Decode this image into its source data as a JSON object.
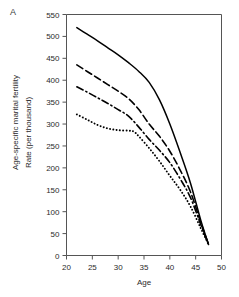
{
  "panel": {
    "label": "A"
  },
  "axes": {
    "x_title": "Age",
    "y_title_outer": "Age-specific marital fertility",
    "y_title_inner": "Rate (per thousand)"
  },
  "chart_data": {
    "type": "line",
    "title": "",
    "subtitle": "",
    "panel_label": "A",
    "xlabel": "Age",
    "ylabel": "Rate (per thousand)",
    "ylabel_secondary": "Age-specific marital fertility",
    "xlim": [
      20,
      50
    ],
    "ylim": [
      0,
      550
    ],
    "xticks": [
      20,
      25,
      30,
      35,
      40,
      45,
      50
    ],
    "yticks": [
      0,
      50,
      100,
      150,
      200,
      250,
      300,
      350,
      400,
      450,
      500,
      550
    ],
    "xtick_labels": [
      "20",
      "25",
      "30",
      "35",
      "40",
      "45",
      "50"
    ],
    "ytick_labels": [
      "0",
      "50",
      "100",
      "150",
      "200",
      "250",
      "300",
      "350",
      "400",
      "450",
      "500",
      "550"
    ],
    "grid": false,
    "legend": "none",
    "series": [
      {
        "name": "Curve 1 (solid)",
        "style": "solid",
        "color": "#000000",
        "x": [
          22,
          24,
          26,
          28,
          30,
          32,
          34,
          36,
          38,
          40,
          42,
          44,
          46,
          47.5
        ],
        "values": [
          520,
          505,
          490,
          474,
          458,
          440,
          420,
          395,
          355,
          300,
          235,
          165,
          80,
          25
        ]
      },
      {
        "name": "Curve 2 (dashed)",
        "style": "dashed",
        "color": "#000000",
        "x": [
          22,
          24,
          26,
          28,
          30,
          32,
          34,
          36,
          38,
          40,
          42,
          44,
          46,
          47.5
        ],
        "values": [
          435,
          420,
          405,
          390,
          375,
          358,
          333,
          300,
          272,
          238,
          195,
          145,
          75,
          25
        ]
      },
      {
        "name": "Curve 3 (dash-dot)",
        "style": "dashdot",
        "color": "#000000",
        "x": [
          22,
          24,
          26,
          28,
          30,
          32,
          34,
          36,
          38,
          40,
          42,
          44,
          46,
          47.5
        ],
        "values": [
          385,
          373,
          360,
          347,
          333,
          318,
          293,
          265,
          240,
          212,
          175,
          132,
          70,
          25
        ]
      },
      {
        "name": "Curve 4 (dotted)",
        "style": "dotted",
        "color": "#000000",
        "x": [
          22,
          24,
          26,
          28,
          30,
          32,
          33,
          34,
          36,
          38,
          40,
          42,
          44,
          46,
          47.5
        ],
        "values": [
          322,
          310,
          298,
          290,
          286,
          285,
          283,
          272,
          245,
          215,
          182,
          150,
          112,
          62,
          25
        ]
      }
    ]
  }
}
